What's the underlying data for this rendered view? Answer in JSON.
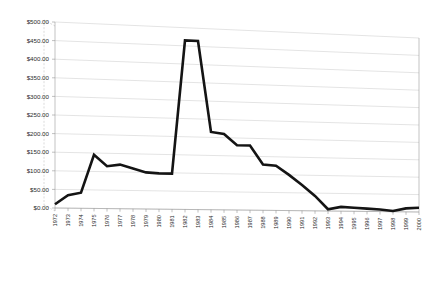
{
  "chart_title": "",
  "chart_data": {
    "type": "line",
    "title": "",
    "subtitle": "",
    "xlabel": "",
    "ylabel": "",
    "ylim": [
      0,
      500
    ],
    "ytick_step": 50,
    "grid": true,
    "legend": "none",
    "style": "3d-perspective-line",
    "line_color": "#141414",
    "gridline_color": "#c8c8c8",
    "axis_color": "#9a9a9a",
    "background_color": "#ffffff",
    "ytick_labels": [
      "$0.00",
      "$50.00",
      "$100.00",
      "$150.00",
      "$200.00",
      "$250.00",
      "$300.00",
      "$350.00",
      "$400.00",
      "$450.00",
      "$500.00"
    ],
    "ytick_values": [
      0,
      50,
      100,
      150,
      200,
      250,
      300,
      350,
      400,
      450,
      500
    ],
    "categories": [
      "1972",
      "1973",
      "1974",
      "1975",
      "1976",
      "1977",
      "1978",
      "1979",
      "1980",
      "1981",
      "1982",
      "1983",
      "1984",
      "1985",
      "1986",
      "1987",
      "1988",
      "1989",
      "1990",
      "1991",
      "1992",
      "1993",
      "1994",
      "1995",
      "1996",
      "1997",
      "1998",
      "1999",
      "2000"
    ],
    "values": [
      10,
      35,
      42,
      145,
      115,
      120,
      110,
      100,
      98,
      98,
      465,
      465,
      215,
      210,
      180,
      180,
      128,
      125,
      100,
      72,
      42,
      5,
      12,
      10,
      8,
      6,
      2,
      10,
      12
    ],
    "series": [
      {
        "name": "Price",
        "values": [
          10,
          35,
          42,
          145,
          115,
          120,
          110,
          100,
          98,
          98,
          465,
          465,
          215,
          210,
          180,
          180,
          128,
          125,
          100,
          72,
          42,
          5,
          12,
          10,
          8,
          6,
          2,
          10,
          12
        ]
      }
    ]
  }
}
